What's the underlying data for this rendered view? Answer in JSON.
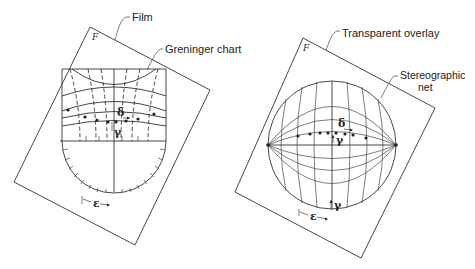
{
  "figure": {
    "left_panel": {
      "frame_label": "F",
      "callouts": {
        "film": "Film",
        "chart": "Greninger chart"
      },
      "symbols": {
        "delta": "δ",
        "gamma": "γ",
        "epsilon": "ε"
      }
    },
    "right_panel": {
      "frame_label": "F",
      "callouts": {
        "overlay": "Transparent overlay",
        "net_line1": "Stereographic",
        "net_line2": "net"
      },
      "symbols": {
        "delta": "δ",
        "gamma_top": "γ",
        "gamma_bottom": "γ",
        "epsilon": "ε"
      }
    }
  },
  "colors": {
    "line": "#333333",
    "background": "#ffffff"
  }
}
